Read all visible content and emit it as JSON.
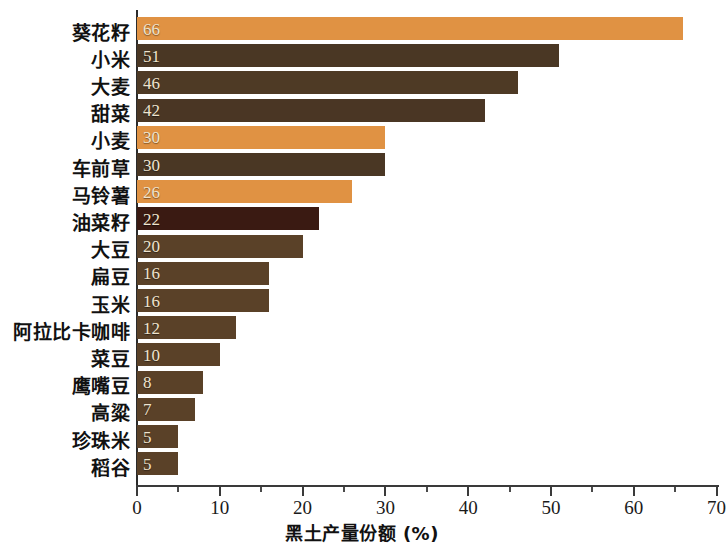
{
  "chart_data": {
    "type": "bar",
    "orientation": "horizontal",
    "title": "",
    "xlabel": "黑土产量份额 (%)",
    "ylabel": "",
    "xlim": [
      0,
      70
    ],
    "xticks": [
      0,
      10,
      20,
      30,
      40,
      50,
      60,
      70
    ],
    "xtick_labels": [
      "0",
      "10",
      "20",
      "30",
      "40",
      "50",
      "60",
      "70"
    ],
    "minor_tick_step": 5,
    "grid": false,
    "legend": null,
    "categories": [
      "葵花籽",
      "小米",
      "大麦",
      "甜菜",
      "小麦",
      "车前草",
      "马铃薯",
      "油菜籽",
      "大豆",
      "扁豆",
      "玉米",
      "阿拉比卡咖啡",
      "菜豆",
      "鹰嘴豆",
      "高粱",
      "珍珠米",
      "稻谷"
    ],
    "values": [
      66,
      51,
      46,
      42,
      30,
      30,
      26,
      22,
      20,
      16,
      16,
      12,
      10,
      8,
      7,
      5,
      5
    ],
    "value_labels": [
      "66",
      "51",
      "46",
      "42",
      "30",
      "30",
      "26",
      "22",
      "20",
      "16",
      "16",
      "12",
      "10",
      "8",
      "7",
      "5",
      "5"
    ],
    "bar_colors": [
      "#E09243",
      "#4A3724",
      "#4E3A25",
      "#4A3624",
      "#E09243",
      "#4A3724",
      "#E09243",
      "#3A1A12",
      "#5A4128",
      "#5A4128",
      "#5A4128",
      "#5A4128",
      "#5A4128",
      "#5A4128",
      "#5A4128",
      "#5A4128",
      "#5A4128"
    ],
    "colors": {
      "highlight": "#E09243",
      "dark_brown": "#4A3724",
      "medium_brown": "#5A4128",
      "darkest": "#3A1A12",
      "background": "#FFFFFF",
      "axis": "#2B2B2B",
      "value_text": "#EFE4CF",
      "label_text": "#111111"
    }
  }
}
